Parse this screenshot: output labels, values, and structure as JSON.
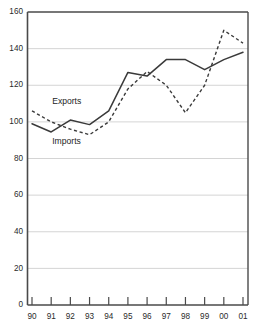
{
  "chart_data": {
    "type": "line",
    "title": "",
    "subtitle": "",
    "xlabel": "",
    "ylabel": "",
    "x": [
      "90",
      "91",
      "92",
      "93",
      "94",
      "95",
      "96",
      "97",
      "98",
      "99",
      "00",
      "01"
    ],
    "categories": [
      "90",
      "91",
      "92",
      "93",
      "94",
      "95",
      "96",
      "97",
      "98",
      "99",
      "00",
      "01"
    ],
    "xtick_labels": [
      "90",
      "91",
      "92",
      "93",
      "94",
      "95",
      "96",
      "97",
      "98",
      "99",
      "00",
      "01"
    ],
    "ytick_labels": [
      "0",
      "20",
      "40",
      "60",
      "80",
      "100",
      "120",
      "140",
      "160"
    ],
    "ytick_values": [
      0,
      20,
      40,
      60,
      80,
      100,
      120,
      140,
      160
    ],
    "ylim": [
      0,
      160
    ],
    "xlim": [
      "90",
      "01"
    ],
    "grid": "horizontal",
    "legend_position": "inline-annotation",
    "series": [
      {
        "name": "Exports",
        "style": "dashed",
        "color": "#3a3a3a",
        "values": [
          106,
          100,
          96,
          93,
          100,
          118,
          127.5,
          120,
          105,
          120,
          150,
          143
        ]
      },
      {
        "name": "Imports",
        "style": "solid",
        "color": "#3a3a3a",
        "values": [
          99,
          94.5,
          101,
          98.5,
          106,
          127,
          125,
          134,
          134,
          128.5,
          134,
          138
        ]
      }
    ],
    "annotations": [
      {
        "text": "Exports",
        "x_value": "91",
        "y_value": 110
      },
      {
        "text": "Imports",
        "x_value": "91",
        "y_value": 88
      }
    ]
  },
  "axis": {
    "y_top_label": "160",
    "y_bottom_label": "0"
  }
}
